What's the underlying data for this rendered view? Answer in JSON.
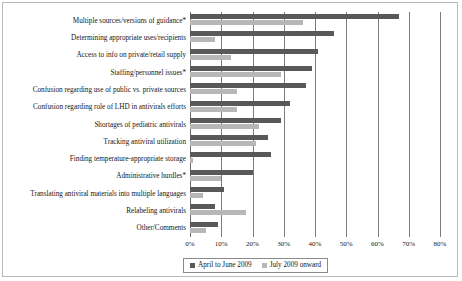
{
  "chart_data": {
    "type": "bar",
    "orientation": "horizontal",
    "title": "",
    "subtitle": "",
    "xlabel": "",
    "ylabel": "",
    "xlim": [
      0,
      80
    ],
    "xtick_labels": [
      "0%",
      "10%",
      "20%",
      "30%",
      "40%",
      "50%",
      "60%",
      "70%",
      "80%"
    ],
    "xtick_values": [
      0,
      10,
      20,
      30,
      40,
      50,
      60,
      70,
      80
    ],
    "grid": true,
    "legend_position": "bottom",
    "categories": [
      "Multiple sources/versions of guidance*",
      "Determining appropriate uses/recipients",
      "Access to info on private/retail supply",
      "Staffing/personnel issues*",
      "Confusion regarding use of public vs. private sources",
      "Confusion regarding role of LHD in antivirals efforts",
      "Shortages of pediatric antivirals",
      "Tracking antiviral utilization",
      "Finding temperature-appropriate storage",
      "Administrative hurdles*",
      "Translating antiviral materials into multiple languages",
      "Relabeling antivirals",
      "Other/Comments"
    ],
    "series": [
      {
        "name": "April to June 2009",
        "color": "#595959",
        "values": [
          67,
          46,
          41,
          39,
          37,
          32,
          29,
          25,
          26,
          20,
          11,
          8,
          9
        ]
      },
      {
        "name": "July 2009 onward",
        "color": "#b7b7b7",
        "values": [
          36,
          8,
          13,
          29,
          15,
          15,
          22,
          21,
          1,
          10,
          4,
          18,
          5
        ]
      }
    ]
  },
  "legend": {
    "entries": [
      {
        "label": "April to June 2009"
      },
      {
        "label": "July 2009 onward"
      }
    ]
  }
}
